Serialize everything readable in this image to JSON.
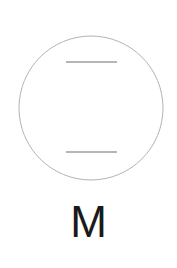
{
  "figure": {
    "kind": "symbol-diagram",
    "background_color": "#ffffff",
    "width": 177,
    "height": 268,
    "caption": "M",
    "caption_color": "#1a1a1a",
    "stroke_color": "#b4b4b4",
    "line_color": "#9e9e9e",
    "shapes": {
      "circle": {
        "name": "outer-circle",
        "center_x": 91,
        "center_y": 108,
        "radius": 72,
        "stroke_width": 1
      },
      "upper_line": {
        "name": "upper-bar",
        "x1": 66,
        "x2": 117,
        "y": 62,
        "stroke_width": 1.4
      },
      "lower_line": {
        "name": "lower-bar",
        "x1": 66,
        "x2": 117,
        "y": 152,
        "stroke_width": 1.4
      }
    }
  },
  "chart_data": {
    "type": "diagram",
    "title": "M",
    "elements": [
      {
        "shape": "circle",
        "cx": 91,
        "cy": 108,
        "r": 72,
        "stroke": "#b4b4b4"
      },
      {
        "shape": "line",
        "x1": 66,
        "y1": 62,
        "x2": 117,
        "y2": 62,
        "stroke": "#9e9e9e"
      },
      {
        "shape": "line",
        "x1": 66,
        "y1": 152,
        "x2": 117,
        "y2": 152,
        "stroke": "#9e9e9e"
      },
      {
        "shape": "text",
        "value": "M",
        "x": 91,
        "y": 232,
        "fill": "#1a1a1a"
      }
    ]
  }
}
